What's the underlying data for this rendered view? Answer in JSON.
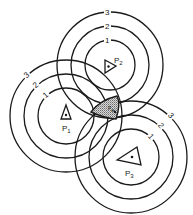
{
  "diagram": {
    "type": "overlapping concentric range circles (trilateration)",
    "stations": [
      {
        "id": "P1",
        "label": "P",
        "subscript": "1",
        "center": [
          66,
          116
        ],
        "radii": [
          28,
          42,
          56
        ],
        "ring_labels": [
          "1",
          "2",
          "3"
        ],
        "triangle": "upward"
      },
      {
        "id": "P2",
        "label": "P",
        "subscript": "2",
        "center": [
          110,
          65
        ],
        "radii": [
          25,
          39,
          53
        ],
        "ring_labels": [
          "1",
          "2",
          "3"
        ],
        "triangle": "right-pointing"
      },
      {
        "id": "P3",
        "label": "P",
        "subscript": "3",
        "center": [
          131,
          157
        ],
        "radii": [
          28,
          42,
          56
        ],
        "ring_labels": [
          "1",
          "2",
          "3"
        ],
        "triangle": "large, left-pointing"
      }
    ],
    "intersection_region": {
      "description": "stippled region where the inner circles overlap",
      "label": "P",
      "sublabel": "e",
      "fill": "stippled gray"
    },
    "colors": {
      "stroke": "#1a1a1a",
      "background": "#ffffff",
      "stipple": "#777777"
    }
  }
}
